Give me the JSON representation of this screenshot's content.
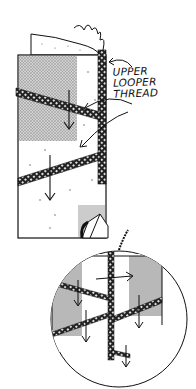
{
  "figure": {
    "type": "technical illustration",
    "callout_label": {
      "line1": "UPPER",
      "line2": "LOOPER",
      "line3": "THREAD"
    },
    "inset": "circular magnified view of seam"
  },
  "colors": {
    "ink": "#111111",
    "shade": "#9a9a9a",
    "paper": "#ffffff"
  }
}
